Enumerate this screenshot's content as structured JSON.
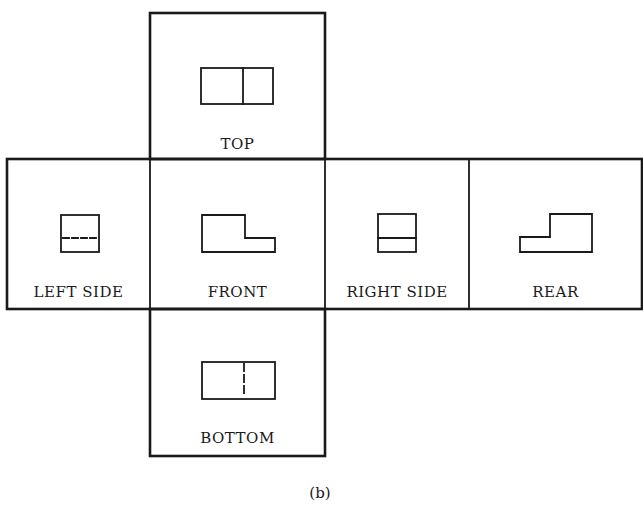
{
  "figure": {
    "caption": "(b)",
    "line_color": "#1a1a1a"
  },
  "views": [
    {
      "id": "top",
      "label": "TOP",
      "shape": "rectangle with solid vertical divider"
    },
    {
      "id": "left-side",
      "label": "LEFT SIDE",
      "shape": "square with dashed (hidden) horizontal line"
    },
    {
      "id": "front",
      "label": "FRONT",
      "shape": "L-shaped step profile, step down on right"
    },
    {
      "id": "right-side",
      "label": "RIGHT SIDE",
      "shape": "square with solid horizontal line"
    },
    {
      "id": "rear",
      "label": "REAR",
      "shape": "reversed L-shaped step profile, step down on left"
    },
    {
      "id": "bottom",
      "label": "BOTTOM",
      "shape": "rectangle with dashed (hidden) vertical divider"
    }
  ]
}
